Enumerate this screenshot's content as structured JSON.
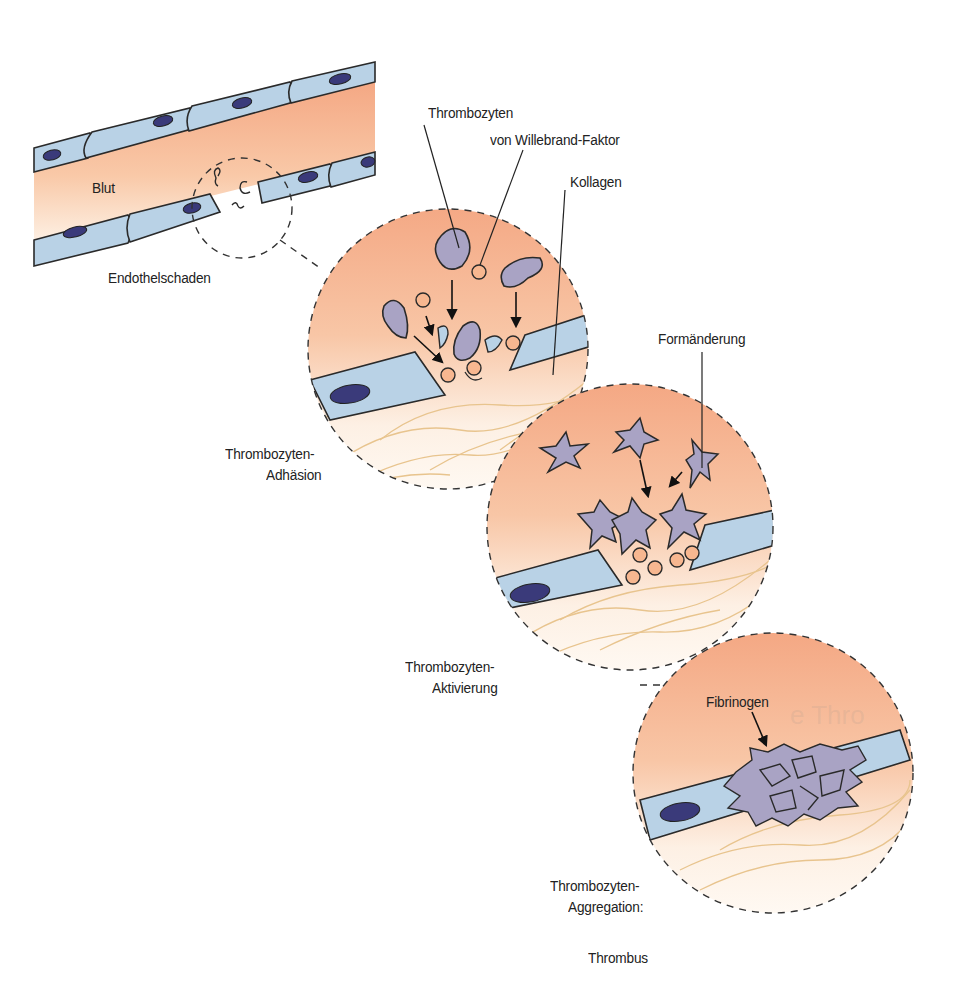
{
  "figure": {
    "colors": {
      "blood": "#f4a783",
      "blood_light": "#fdf1e6",
      "endothelium": "#b9d2e6",
      "nucleus": "#3a3a7a",
      "platelet": "#a9a3c4",
      "vwf": "#f7b790",
      "collagen": "#e8c48e",
      "outline": "#2a2a2a"
    }
  },
  "labels": {
    "blut": "Blut",
    "endothelschaden": "Endothelschaden",
    "thrombozyten": "Thrombozyten",
    "von_willebrand": "von Willebrand-Faktor",
    "kollagen": "Kollagen",
    "adhaesion_line1": "Thrombozyten-",
    "adhaesion_line2": "Adhäsion",
    "formaenderung": "Formänderung",
    "aktivierung_line1": "Thrombozyten-",
    "aktivierung_line2": "Aktivierung",
    "fibrinogen": "Fibrinogen",
    "aggregation_line1": "Thrombozyten-",
    "aggregation_line2": "Aggregation:",
    "thrombus": "Thrombus",
    "ghost_text": "e Thro"
  },
  "stages": [
    {
      "id": "vessel-overview",
      "caption": "Endothelschaden"
    },
    {
      "id": "adhesion",
      "caption": "Thrombozyten-Adhäsion"
    },
    {
      "id": "activation",
      "caption": "Thrombozyten-Aktivierung"
    },
    {
      "id": "aggregation",
      "caption": "Thrombozyten-Aggregation: Thrombus"
    }
  ]
}
